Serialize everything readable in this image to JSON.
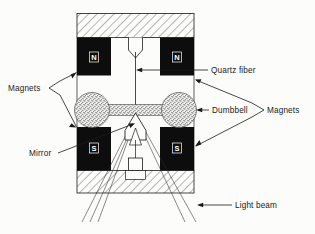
{
  "figure": {
    "background_color": "#fcfcfb",
    "ink_color": "#1a1a1a",
    "magnet_fill": "#0d0d0d",
    "pole_label_color": "#ffffff",
    "stipple_color": "#777777"
  },
  "labels": {
    "magnets_left": "Magnets",
    "magnets_right": "Magnets",
    "quartz_fiber": "Quartz fiber",
    "dumbbell": "Dumbbell",
    "mirror": "Mirror",
    "light_beam": "Light beam"
  },
  "poles": {
    "top_left": "N",
    "top_right": "N",
    "bottom_left": "S",
    "bottom_right": "S"
  },
  "components": [
    {
      "name": "top-hatched-frame",
      "kind": "hatched-block"
    },
    {
      "name": "bottom-hatched-frame",
      "kind": "hatched-block"
    },
    {
      "name": "magnet-top-left",
      "pole": "N"
    },
    {
      "name": "magnet-top-right",
      "pole": "N"
    },
    {
      "name": "magnet-bottom-left",
      "pole": "S"
    },
    {
      "name": "magnet-bottom-right",
      "pole": "S"
    },
    {
      "name": "quartz-fiber",
      "kind": "vertical-line"
    },
    {
      "name": "fiber-mount-cone",
      "kind": "funnel"
    },
    {
      "name": "dumbbell",
      "kind": "stippled-dumbbell"
    },
    {
      "name": "mirror",
      "kind": "triangle"
    },
    {
      "name": "light-beam",
      "kind": "ray-bundle"
    }
  ]
}
